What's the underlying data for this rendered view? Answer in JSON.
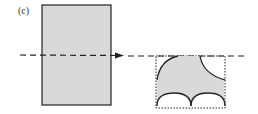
{
  "figure": {
    "panel_label": "(c)",
    "colors": {
      "fill": "#d9d9d9",
      "stroke": "#222222",
      "background": "#ffffff"
    },
    "elements": {
      "source_shape": "rectangle",
      "cut_line": "dashed-line-with-arrow",
      "result_bounds": "dotted-rectangle",
      "result_shape": "shaded-region-with-arcs"
    }
  }
}
